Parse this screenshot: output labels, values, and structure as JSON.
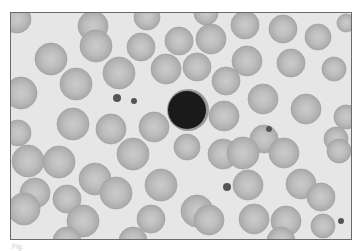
{
  "image": {
    "subject": "blood smear micrograph",
    "description": "Grayscale micrograph of red blood cells surrounding a single dark-staining small lymphocyte, with a few scattered platelets",
    "background_color": "#e6e6e6",
    "rbc_fill": "#b4b4b4",
    "rbc_center": "#c8c8c8",
    "lymphocyte_fill": "#1a1a1a",
    "platelet_fill": "#555555"
  },
  "rbcs": [
    [
      16,
      18,
      14
    ],
    [
      92,
      25,
      15
    ],
    [
      146,
      16,
      13
    ],
    [
      205,
      12,
      12
    ],
    [
      244,
      24,
      14
    ],
    [
      282,
      28,
      14
    ],
    [
      317,
      36,
      13
    ],
    [
      345,
      22,
      9
    ],
    [
      50,
      58,
      16
    ],
    [
      95,
      45,
      16
    ],
    [
      140,
      46,
      14
    ],
    [
      178,
      40,
      14
    ],
    [
      210,
      38,
      15
    ],
    [
      246,
      60,
      15
    ],
    [
      290,
      62,
      14
    ],
    [
      333,
      68,
      12
    ],
    [
      20,
      92,
      16
    ],
    [
      75,
      83,
      16
    ],
    [
      118,
      72,
      16
    ],
    [
      165,
      68,
      15
    ],
    [
      196,
      66,
      14
    ],
    [
      225,
      80,
      14
    ],
    [
      262,
      98,
      15
    ],
    [
      305,
      108,
      15
    ],
    [
      345,
      116,
      12
    ],
    [
      17,
      132,
      13
    ],
    [
      72,
      123,
      16
    ],
    [
      110,
      128,
      15
    ],
    [
      153,
      126,
      15
    ],
    [
      223,
      115,
      15
    ],
    [
      263,
      138,
      14
    ],
    [
      335,
      138,
      12
    ],
    [
      27,
      160,
      16
    ],
    [
      58,
      161,
      16
    ],
    [
      132,
      153,
      16
    ],
    [
      186,
      146,
      13
    ],
    [
      222,
      153,
      15
    ],
    [
      242,
      152,
      16
    ],
    [
      283,
      152,
      15
    ],
    [
      338,
      150,
      12
    ],
    [
      34,
      192,
      15
    ],
    [
      94,
      178,
      16
    ],
    [
      115,
      192,
      16
    ],
    [
      160,
      184,
      16
    ],
    [
      247,
      184,
      15
    ],
    [
      300,
      183,
      15
    ],
    [
      320,
      196,
      14
    ],
    [
      23,
      208,
      16
    ],
    [
      66,
      198,
      14
    ],
    [
      82,
      220,
      16
    ],
    [
      150,
      218,
      14
    ],
    [
      196,
      210,
      16
    ],
    [
      208,
      219,
      15
    ],
    [
      253,
      218,
      15
    ],
    [
      285,
      220,
      15
    ],
    [
      322,
      225,
      12
    ],
    [
      66,
      240,
      14
    ],
    [
      132,
      240,
      14
    ],
    [
      280,
      240,
      14
    ]
  ],
  "lymphocyte": {
    "cx": 186,
    "cy": 109,
    "r": 19
  },
  "platelets": [
    [
      116,
      97,
      4
    ],
    [
      133,
      100,
      3
    ],
    [
      268,
      128,
      3
    ],
    [
      226,
      186,
      4
    ],
    [
      340,
      220,
      3
    ]
  ],
  "caption": "Fig."
}
